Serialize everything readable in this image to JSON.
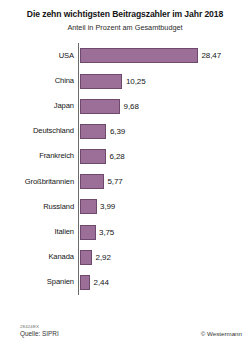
{
  "chart_data": {
    "type": "bar",
    "orientation": "horizontal",
    "title": "Die zehn wichtigsten Beitragszahler im Jahr 2018",
    "subtitle": "Anteil in Prozent am Gesamtbudget",
    "xlabel": "",
    "ylabel": "",
    "grid": false,
    "legend": "none",
    "xlim": [
      0,
      28.47
    ],
    "value_labels_shown": true,
    "decimal_separator": ",",
    "bar_color": "#9c6f99",
    "bar_border_color": "#6d4a6b",
    "axis_color": "#6b6b6b",
    "categories": [
      "USA",
      "China",
      "Japan",
      "Deutschland",
      "Frankreich",
      "Großbritannien",
      "Russland",
      "Italien",
      "Kanada",
      "Spanien"
    ],
    "values": [
      28.47,
      10.25,
      9.68,
      6.39,
      6.28,
      5.77,
      3.99,
      3.75,
      2.92,
      2.44
    ],
    "value_labels": [
      "28,47",
      "10,25",
      "9,68",
      "6,39",
      "6,28",
      "5,77",
      "3,99",
      "3,75",
      "2,92",
      "2,44"
    ]
  },
  "footer": {
    "figure_code": "28424EX",
    "source": "Quelle: SIPRI",
    "copyright": "© Westermann"
  }
}
